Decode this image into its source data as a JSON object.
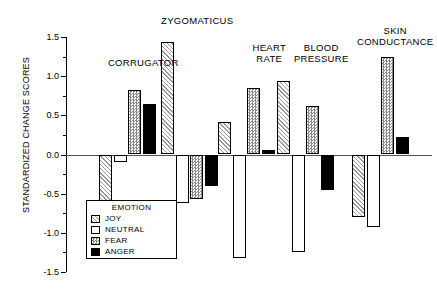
{
  "chart_data": {
    "type": "bar",
    "title": "",
    "xlabel": "",
    "ylabel": "STANDARDIZED CHANGE SCORES",
    "ylim": [
      -1.5,
      1.5
    ],
    "ytick_labels": [
      "1.5",
      "1.0",
      "0.5",
      "0.0",
      "-0.5",
      "-1.0",
      "-1.5"
    ],
    "ytick_values": [
      1.5,
      1.0,
      0.5,
      0.0,
      -0.5,
      -1.0,
      -1.5
    ],
    "minor_tick_step": 0.25,
    "grid": false,
    "legend_title": "EMOTION",
    "legend_position": "lower-left-inside",
    "categories": [
      "CORRUGATOR",
      "ZYGOMATICUS",
      "HEART\nRATE",
      "BLOOD\nPRESSURE",
      "SKIN\nCONDUCTANCE"
    ],
    "series": [
      {
        "name": "JOY",
        "pattern": "diagonal-hatch",
        "values": [
          -1.33,
          1.44,
          0.42,
          0.94,
          -0.8
        ]
      },
      {
        "name": "NEUTRAL",
        "pattern": "open-white",
        "values": [
          -0.09,
          -0.62,
          -1.32,
          -1.25,
          -0.93
        ]
      },
      {
        "name": "FEAR",
        "pattern": "checkered",
        "values": [
          0.82,
          -0.57,
          0.85,
          0.62,
          1.25
        ]
      },
      {
        "name": "ANGER",
        "pattern": "solid-black",
        "values": [
          0.64,
          -0.4,
          0.06,
          -0.45,
          0.22
        ]
      }
    ]
  },
  "legend": {
    "title": "EMOTION",
    "items": [
      {
        "label": "JOY"
      },
      {
        "label": "NEUTRAL"
      },
      {
        "label": "FEAR"
      },
      {
        "label": "ANGER"
      }
    ]
  },
  "axis": {
    "y_title": "STANDARDIZED CHANGE SCORES"
  }
}
